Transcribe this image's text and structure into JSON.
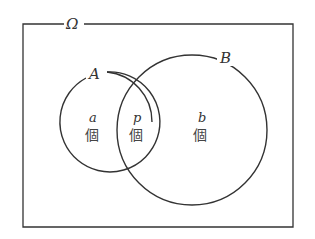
{
  "diagram": {
    "universe_label": "Ω",
    "sets": [
      {
        "label": "A"
      },
      {
        "label": "B"
      }
    ],
    "regions": [
      {
        "var": "a",
        "unit": "個"
      },
      {
        "var": "p",
        "unit": "個"
      },
      {
        "var": "b",
        "unit": "個"
      }
    ],
    "stroke_color": "#333333"
  }
}
